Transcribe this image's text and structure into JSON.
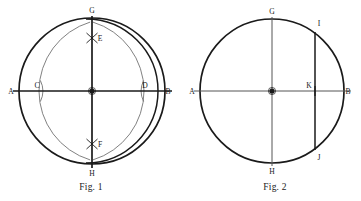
{
  "page": {
    "background_color": "#ffffff",
    "ink_color": "#1a1a1a",
    "light_ink_color": "#555555",
    "width": 361,
    "height": 201
  },
  "figures": [
    {
      "id": "fig1",
      "caption": "Fig. 1",
      "description": "Circle with perpendicular diameters constructed by compass arcs",
      "circle": {
        "cx": 92,
        "cy": 91,
        "r": 73
      },
      "points": [
        {
          "name": "A",
          "label": "A",
          "x": 19,
          "y": 91,
          "label_x": 11,
          "label_y": 94
        },
        {
          "name": "B",
          "label": "B",
          "x": 165,
          "y": 91,
          "label_x": 168,
          "label_y": 94
        },
        {
          "name": "C",
          "label": "C",
          "x": 42,
          "y": 91,
          "label_x": 36,
          "label_y": 87
        },
        {
          "name": "D",
          "label": "D",
          "x": 141,
          "y": 91,
          "label_x": 143,
          "label_y": 87
        },
        {
          "name": "E",
          "label": "E",
          "x": 92,
          "y": 38,
          "label_x": 96,
          "label_y": 40
        },
        {
          "name": "F",
          "label": "F",
          "x": 92,
          "y": 144,
          "label_x": 96,
          "label_y": 147
        },
        {
          "name": "G",
          "label": "G",
          "x": 92,
          "y": 18,
          "label_x": 89,
          "label_y": 14
        },
        {
          "name": "H",
          "label": "H",
          "x": 92,
          "y": 164,
          "label_x": 89,
          "label_y": 173
        },
        {
          "name": "O",
          "label": "",
          "x": 92,
          "y": 91,
          "label_x": 92,
          "label_y": 91
        }
      ],
      "lines": [
        {
          "name": "diameter-ab",
          "x1": 13,
          "y1": 91,
          "x2": 172,
          "y2": 91
        },
        {
          "name": "diameter-gh",
          "x1": 92,
          "y1": 16,
          "x2": 92,
          "y2": 168
        }
      ],
      "arcs": [
        {
          "name": "vesica-arc-from-c",
          "cx": 42,
          "cy": 91,
          "r": 72,
          "from_deg": -47,
          "to_deg": 47
        },
        {
          "name": "vesica-arc-from-d",
          "cx": 141,
          "cy": 91,
          "r": 72,
          "from_deg": 133,
          "to_deg": 227
        },
        {
          "name": "tick-arc-c",
          "cx": 19,
          "cy": 91,
          "r": 24,
          "from_deg": -26,
          "to_deg": 26
        },
        {
          "name": "tick-arc-d",
          "cx": 165,
          "cy": 91,
          "r": 24,
          "from_deg": 154,
          "to_deg": 206
        }
      ]
    },
    {
      "id": "fig2",
      "caption": "Fig. 2",
      "description": "Circle with perpendicular diameters and a secondary arc cutting chord IJ",
      "circle": {
        "cx": 272,
        "cy": 91,
        "r": 72
      },
      "points": [
        {
          "name": "A",
          "label": "A",
          "x": 200,
          "y": 91,
          "label_x": 192,
          "label_y": 94
        },
        {
          "name": "B",
          "label": "B",
          "x": 344,
          "y": 91,
          "label_x": 347,
          "label_y": 94
        },
        {
          "name": "G",
          "label": "G",
          "x": 272,
          "y": 19,
          "label_x": 269,
          "label_y": 14
        },
        {
          "name": "H",
          "label": "H",
          "x": 272,
          "y": 163,
          "label_x": 269,
          "label_y": 172
        },
        {
          "name": "I",
          "label": "I",
          "x": 315,
          "y": 33,
          "label_x": 317,
          "label_y": 27
        },
        {
          "name": "J",
          "label": "J",
          "x": 315,
          "y": 149,
          "label_x": 317,
          "label_y": 159
        },
        {
          "name": "K",
          "label": "K",
          "x": 315,
          "y": 91,
          "label_x": 308,
          "label_y": 88
        },
        {
          "name": "O",
          "label": "",
          "x": 272,
          "y": 91,
          "label_x": 272,
          "label_y": 91
        }
      ],
      "lines": [
        {
          "name": "diameter-ab",
          "x1": 194,
          "y1": 91,
          "x2": 351,
          "y2": 91
        },
        {
          "name": "diameter-gh",
          "x1": 272,
          "y1": 17,
          "x2": 272,
          "y2": 166
        },
        {
          "name": "chord-ij",
          "x1": 315,
          "y1": 33,
          "x2": 315,
          "y2": 149
        }
      ],
      "arcs": [
        {
          "name": "secondary-arc",
          "cx": 272,
          "cy": 91,
          "r": 72,
          "from_deg": -54,
          "to_deg": 54,
          "mirrored": true
        }
      ]
    }
  ]
}
